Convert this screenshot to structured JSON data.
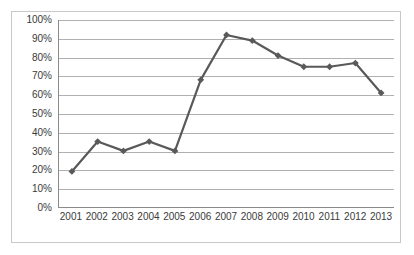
{
  "chart_data": {
    "type": "line",
    "title": "",
    "subtitle": "",
    "xlabel": "",
    "ylabel": "",
    "categories": [
      "2001",
      "2002",
      "2003",
      "2004",
      "2005",
      "2006",
      "2007",
      "2008",
      "2009",
      "2010",
      "2011",
      "2012",
      "2013"
    ],
    "values": [
      19,
      35,
      30,
      35,
      30,
      68,
      92,
      89,
      81,
      75,
      75,
      77,
      61
    ],
    "series": [
      {
        "name": "",
        "values": [
          19,
          35,
          30,
          35,
          30,
          68,
          92,
          89,
          81,
          75,
          75,
          77,
          61
        ]
      }
    ],
    "ylim": [
      0,
      100
    ],
    "ytick_labels": [
      "0%",
      "10%",
      "20%",
      "30%",
      "40%",
      "50%",
      "60%",
      "70%",
      "80%",
      "90%",
      "100%"
    ],
    "ytick_values": [
      0,
      10,
      20,
      30,
      40,
      50,
      60,
      70,
      80,
      90,
      100
    ],
    "value_suffix": "%",
    "grid": true,
    "legend": false,
    "legend_position": "none",
    "marker": "diamond",
    "line_color": "#595959",
    "marker_color": "#595959",
    "gridline_color": "#b0b0b0",
    "axis_color": "#8a8a8a",
    "border_color": "#c9c9c9",
    "background_color": "#ffffff"
  }
}
